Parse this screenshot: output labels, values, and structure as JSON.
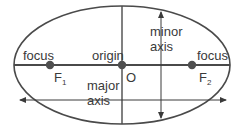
{
  "diagram": {
    "type": "ellipse-anatomy",
    "colors": {
      "stroke": "#4a4a4a",
      "dot": "#4f4f4f",
      "text": "#3a3a3a",
      "background": "#ffffff"
    },
    "labels": {
      "focus_left": "focus",
      "f1_main": "F",
      "f1_sub": "1",
      "origin": "origin",
      "origin_point": "O",
      "minor_line1": "minor",
      "minor_line2": "axis",
      "focus_right": "focus",
      "f2_main": "F",
      "f2_sub": "2",
      "major_line1": "major",
      "major_line2": "axis"
    }
  }
}
